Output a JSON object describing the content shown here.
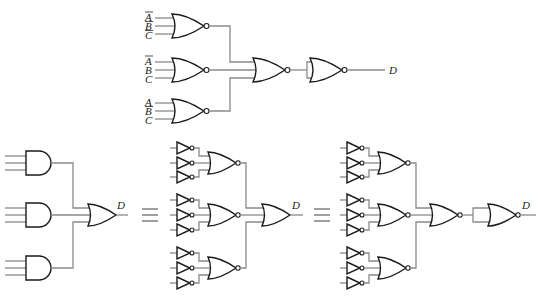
{
  "diagram": {
    "type": "logic-circuit-equivalence",
    "top_circuit": {
      "gate_groups": [
        {
          "inputs": [
            "A̅",
            "B̅",
            "C̅"
          ],
          "gate": "NOR"
        },
        {
          "inputs": [
            "A̅",
            "B",
            "C"
          ],
          "gate": "NOR"
        },
        {
          "inputs": [
            "A",
            "B̅",
            "C"
          ],
          "gate": "NOR"
        }
      ],
      "combine_gate": "NOR",
      "final_gate": "NOR (inputs tied, acts as inverter)",
      "output": "D"
    },
    "bottom_circuits": [
      {
        "name": "AND-OR",
        "first_level": "AND x3",
        "second_level": "OR",
        "output": "D"
      },
      {
        "name": "inverted-inputs NOR-OR",
        "first_level": "NOT inputs + NOR x3",
        "second_level": "OR",
        "output": "D"
      },
      {
        "name": "all-NOR",
        "first_level": "NOT inputs + NOR x3",
        "second_level": "NOR",
        "third_level": "NOR (inputs tied)",
        "output": "D"
      }
    ],
    "equivalence_symbol": "≡",
    "labels": {
      "output": "D",
      "g1": [
        "A",
        "B",
        "C"
      ],
      "g2": [
        "A",
        "B",
        "C"
      ],
      "g3": [
        "A",
        "B",
        "C"
      ]
    }
  }
}
